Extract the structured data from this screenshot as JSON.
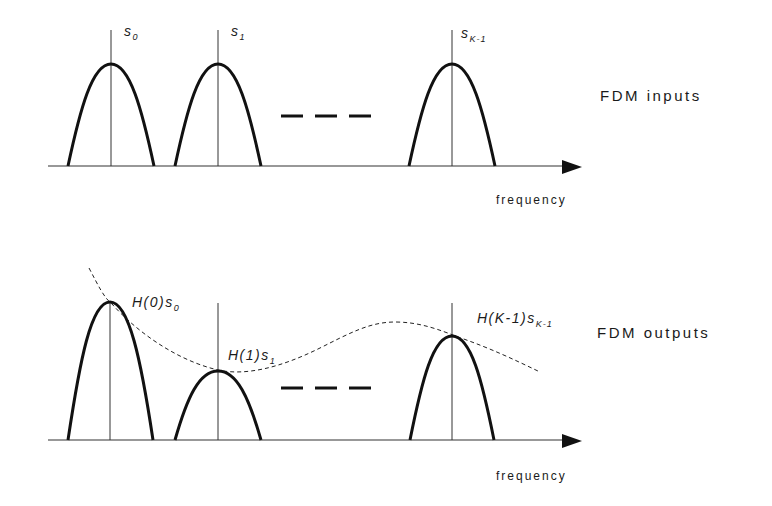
{
  "top_panel": {
    "title": "FDM inputs",
    "axis_label": "frequency",
    "signals": [
      {
        "name": "s",
        "sub": "0",
        "center_x": 111,
        "peak_y": 64
      },
      {
        "name": "s",
        "sub": "1",
        "center_x": 218,
        "peak_y": 64
      },
      {
        "name": "s",
        "sub": "K-1",
        "center_x": 452,
        "peak_y": 64
      }
    ],
    "ellipsis": "— — —"
  },
  "bottom_panel": {
    "title": "FDM outputs",
    "axis_label": "frequency",
    "signals": [
      {
        "prefix": "H(0)",
        "name": "s",
        "sub": "0",
        "center_x": 110,
        "peak_y": 302
      },
      {
        "prefix": "H(1)",
        "name": "s",
        "sub": "1",
        "center_x": 218,
        "peak_y": 371
      },
      {
        "prefix": "H(K-1)",
        "name": "s",
        "sub": "K-1",
        "center_x": 452,
        "peak_y": 336
      }
    ],
    "channel_response": "H(f)",
    "ellipsis": "— — —"
  },
  "colors": {
    "line": "#111111",
    "background": "#ffffff"
  }
}
